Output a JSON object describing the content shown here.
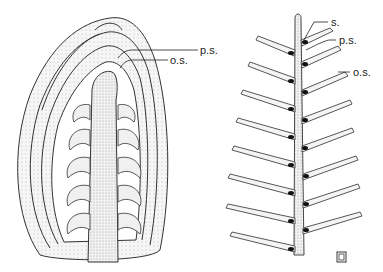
{
  "figure": {
    "left_panel": {
      "description": "Longitudinal section of bud with scale primordia",
      "labels": [
        {
          "id": "ps",
          "text": "p.s."
        },
        {
          "id": "os",
          "text": "o.s."
        }
      ]
    },
    "right_panel": {
      "description": "Axis with paired scales",
      "labels": [
        {
          "id": "s",
          "text": "s."
        },
        {
          "id": "ps",
          "text": "p.s."
        },
        {
          "id": "os",
          "text": "o.s."
        }
      ]
    },
    "monogram": "ℂ"
  },
  "colors": {
    "ink": "#333333",
    "stipple": "#bdbdbd",
    "fill": "#e6e6e6",
    "background": "#ffffff"
  }
}
